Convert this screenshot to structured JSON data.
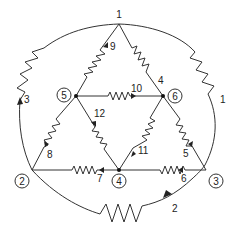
{
  "diagram": {
    "type": "circuit-graph",
    "nodes": [
      {
        "id": "1",
        "label": "1"
      },
      {
        "id": "2",
        "label": "2"
      },
      {
        "id": "3",
        "label": "3"
      },
      {
        "id": "4",
        "label": "4"
      },
      {
        "id": "5",
        "label": "5"
      },
      {
        "id": "6",
        "label": "6"
      }
    ],
    "branches": [
      {
        "id": "1",
        "label": "1",
        "from": "1",
        "to": "3",
        "element": "resistor"
      },
      {
        "id": "2",
        "label": "2",
        "from": "2",
        "to": "3",
        "element": "resistor"
      },
      {
        "id": "3",
        "label": "3",
        "from": "2",
        "to": "1",
        "element": "resistor"
      },
      {
        "id": "4",
        "label": "4",
        "from": "1",
        "to": "6",
        "element": "resistor"
      },
      {
        "id": "5",
        "label": "5",
        "from": "3",
        "to": "6",
        "element": "resistor"
      },
      {
        "id": "6",
        "label": "6",
        "from": "3",
        "to": "4",
        "element": "resistor"
      },
      {
        "id": "7",
        "label": "7",
        "from": "4",
        "to": "2",
        "element": "resistor"
      },
      {
        "id": "8",
        "label": "8",
        "from": "2",
        "to": "5",
        "element": "resistor"
      },
      {
        "id": "9",
        "label": "9",
        "from": "5",
        "to": "1",
        "element": "resistor"
      },
      {
        "id": "10",
        "label": "10",
        "from": "5",
        "to": "6",
        "element": "resistor"
      },
      {
        "id": "11",
        "label": "11",
        "from": "6",
        "to": "4",
        "element": "resistor"
      },
      {
        "id": "12",
        "label": "12",
        "from": "5",
        "to": "4",
        "element": "resistor"
      }
    ]
  }
}
